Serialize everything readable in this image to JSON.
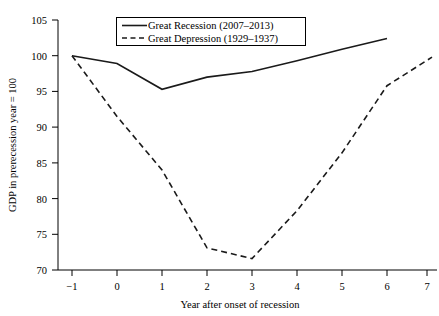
{
  "chart_data": {
    "type": "line",
    "title": "",
    "xlabel": "Year after onset of recession",
    "ylabel": "GDP in prerecession year = 100",
    "x": [
      -1,
      0,
      1,
      2,
      3,
      4,
      5,
      6,
      7
    ],
    "xlim": [
      -1,
      7.3
    ],
    "ylim": [
      70,
      105
    ],
    "xticks": [
      "−1",
      "0",
      "1",
      "2",
      "3",
      "4",
      "5",
      "6",
      "7"
    ],
    "yticks": [
      "70",
      "75",
      "80",
      "85",
      "90",
      "95",
      "100",
      "105"
    ],
    "grid": false,
    "legend_position": "top-center",
    "series": [
      {
        "name": "Great Recession (2007–2013)",
        "style": "solid",
        "x": [
          -1,
          0,
          1,
          2,
          3,
          4,
          5,
          6
        ],
        "values": [
          100.0,
          98.9,
          95.3,
          97.0,
          97.8,
          99.3,
          100.9,
          102.4
        ]
      },
      {
        "name": "Great Depression (1929–1937)",
        "style": "dashed",
        "x": [
          -1,
          0,
          1,
          2,
          3,
          4,
          5,
          6,
          7
        ],
        "values": [
          100.0,
          91.5,
          84.0,
          73.1,
          71.6,
          78.3,
          86.4,
          95.8,
          99.8
        ]
      }
    ]
  },
  "legend": {
    "entries": [
      {
        "label": "Great Recession (2007–2013)",
        "style": "solid"
      },
      {
        "label": "Great Depression (1929–1937)",
        "style": "dashed"
      }
    ]
  },
  "axes": {
    "y_title": "GDP in prerecession year = 100",
    "x_title": "Year after onset of recession",
    "y_tick_labels": [
      "105",
      "100",
      "95",
      "90",
      "85",
      "80",
      "75",
      "70"
    ],
    "x_tick_labels": [
      "−1",
      "0",
      "1",
      "2",
      "3",
      "4",
      "5",
      "6",
      "7"
    ]
  },
  "colors": {
    "line": "#1a1a1a",
    "axis": "#000000",
    "background": "#ffffff"
  }
}
